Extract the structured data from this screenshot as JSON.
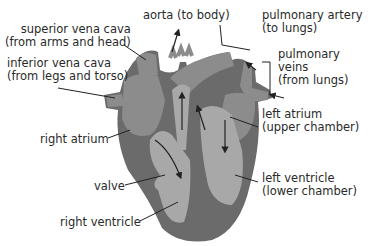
{
  "diagram": {
    "colors": {
      "outer_wall": "#6b6b6b",
      "vessel": "#8c8c8c",
      "chamber": "#a8a8a8",
      "text": "#2a2a2a",
      "background": "#ffffff"
    },
    "labels": {
      "superior_vena_cava": {
        "line1": "superior vena cava",
        "line2": "(from arms and head)"
      },
      "inferior_vena_cava": {
        "line1": "inferior vena cava",
        "line2": "(from legs and torso)"
      },
      "aorta": {
        "line1": "aorta (to body)"
      },
      "pulmonary_artery": {
        "line1": "pulmonary artery",
        "line2": "(to lungs)"
      },
      "pulmonary_veins": {
        "line1": "pulmonary",
        "line2": "veins",
        "line3": "(from lungs)"
      },
      "left_atrium": {
        "line1": "left atrium",
        "line2": "(upper chamber)"
      },
      "right_atrium": {
        "line1": "right atrium"
      },
      "valve": {
        "line1": "valve"
      },
      "left_ventricle": {
        "line1": "left ventricle",
        "line2": "(lower chamber)"
      },
      "right_ventricle": {
        "line1": "right ventricle"
      }
    }
  }
}
